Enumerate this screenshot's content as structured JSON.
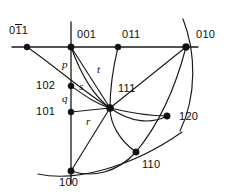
{
  "figure": {
    "type": "crystallographic-pole-network-diagram",
    "background_color": "#ffffff",
    "line_color": "#1a1a1a",
    "text_color": "#0d0d0d",
    "width": 228,
    "height": 194
  },
  "nodes": [
    {
      "id": "n-0bar11",
      "label_prefix": "0",
      "label_overbar": "1",
      "label_suffix": "1",
      "label_full": "0̅1̅1",
      "has_overbar": true,
      "x": 27,
      "y": 47
    },
    {
      "id": "n-001",
      "label": "001",
      "has_overbar": false,
      "x": 71,
      "y": 47
    },
    {
      "id": "n-011",
      "label": "011",
      "has_overbar": false,
      "x": 118,
      "y": 47
    },
    {
      "id": "n-010",
      "label": "010",
      "has_overbar": false,
      "x": 186,
      "y": 47
    },
    {
      "id": "n-102",
      "label": "102",
      "has_overbar": false,
      "x": 71,
      "y": 86
    },
    {
      "id": "n-101",
      "label": "101",
      "has_overbar": false,
      "x": 71,
      "y": 112
    },
    {
      "id": "n-111",
      "label": "111",
      "has_overbar": false,
      "x": 110,
      "y": 108
    },
    {
      "id": "n-120",
      "label": "120",
      "has_overbar": false,
      "x": 167,
      "y": 116
    },
    {
      "id": "n-110",
      "label": "110",
      "has_overbar": false,
      "x": 136,
      "y": 152
    },
    {
      "id": "n-100",
      "label": "100",
      "has_overbar": false,
      "x": 71,
      "y": 171
    }
  ],
  "node_labels": [
    {
      "name": "label-0bar11",
      "text": "011",
      "overbar_char": "1",
      "lead_char": "0",
      "tail_char": "1",
      "x": 9,
      "y": 25
    },
    {
      "name": "label-001",
      "text": "001",
      "x": 77,
      "y": 30
    },
    {
      "name": "label-011",
      "text": "011",
      "x": 122,
      "y": 30
    },
    {
      "name": "label-010",
      "text": "010",
      "x": 196,
      "y": 30
    },
    {
      "name": "label-102",
      "text": "102",
      "x": 38,
      "y": 80
    },
    {
      "name": "label-101",
      "text": "101",
      "x": 38,
      "y": 106
    },
    {
      "name": "label-111",
      "text": "111",
      "x": 117,
      "y": 84
    },
    {
      "name": "label-120",
      "text": "120",
      "x": 178,
      "y": 112
    },
    {
      "name": "label-110",
      "text": "110",
      "x": 141,
      "y": 160
    },
    {
      "name": "label-100",
      "text": "100",
      "x": 60,
      "y": 178
    }
  ],
  "edge_labels": [
    {
      "name": "edge-label-p",
      "text": "p",
      "x": 62,
      "y": 60
    },
    {
      "name": "edge-label-t",
      "text": "t",
      "x": 98,
      "y": 66
    },
    {
      "name": "edge-label-s",
      "text": "s",
      "x": 80,
      "y": 82
    },
    {
      "name": "edge-label-q",
      "text": "q",
      "x": 62,
      "y": 94
    },
    {
      "name": "edge-label-r",
      "text": "r",
      "x": 86,
      "y": 117
    }
  ],
  "geometry": {
    "horizontal_axis": {
      "x1": 12,
      "y1": 47,
      "x2": 198,
      "y2": 47
    },
    "vertical_axis": {
      "x1": 71,
      "y1": 22,
      "x2": 71,
      "y2": 184
    },
    "great_circle_right": "M 183 19 C 196 52, 197 96, 180 131",
    "great_circle_bottom": "M 38 174 C 75 182, 130 168, 183 131",
    "arc_001_to_110": "M 71 47 C 86 75, 110 120, 136 152",
    "arc_011_to_120": "M 118 47 C 121 72, 135 100, 167 116",
    "arc_010_to_100": "M 186 47 C 160 100, 120 148, 71 171",
    "arc_0bar11_to_111_ext": "M 27 47 C 55 66, 88 92, 110 108",
    "arc_102_to_120": "M 71 86 C 100 96, 140 112, 167 116",
    "seg_101_to_111": "M 71 112 L 110 108",
    "seg_111_to_010": "M 110 108 L 186 47",
    "seg_111_to_100": "M 110 108 L 71 171",
    "seg_111_to_011_line": "M 118 47 L 110 108",
    "seg_001_to_111": "M 71 47 L 110 108"
  }
}
